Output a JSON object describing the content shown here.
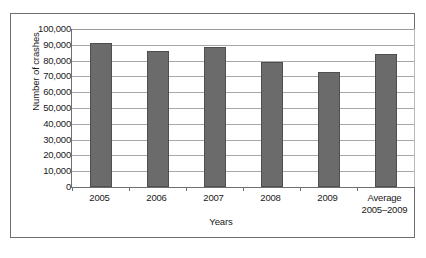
{
  "chart_data": {
    "type": "bar",
    "title": "",
    "xlabel": "Years",
    "ylabel": "Number of crashes",
    "categories": [
      "2005",
      "2006",
      "2007",
      "2008",
      "2009",
      "Average 2005–2009"
    ],
    "category_lines": [
      [
        "2005"
      ],
      [
        "2006"
      ],
      [
        "2007"
      ],
      [
        "2008"
      ],
      [
        "2009"
      ],
      [
        "Average",
        "2005–2009"
      ]
    ],
    "values": [
      91000,
      86000,
      88500,
      79000,
      72500,
      84000
    ],
    "ylim": [
      0,
      100000
    ],
    "ytick_values": [
      0,
      10000,
      20000,
      30000,
      40000,
      50000,
      60000,
      70000,
      80000,
      90000,
      100000
    ],
    "ytick_labels": [
      "0",
      "10,000",
      "20,000",
      "30,000",
      "40,000",
      "50,000",
      "60,000",
      "70,000",
      "80,000",
      "90,000",
      "100,000"
    ],
    "grid": "horizontal",
    "legend": "none",
    "bar_color": "#6b6b6b",
    "bar_edge_color": "#4f4f4f",
    "gridline_color": "#a8a8a8",
    "axis_color": "#6e6e6e",
    "frame_color": "#6e6e6e",
    "background_color": "#ffffff"
  }
}
